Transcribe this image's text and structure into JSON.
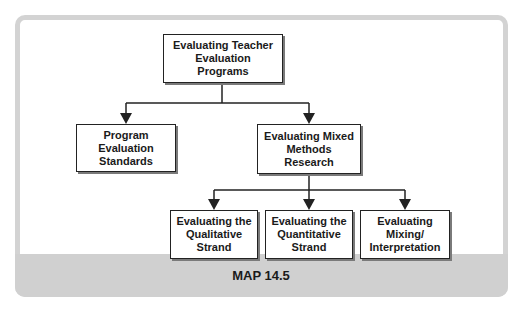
{
  "figure": {
    "caption": "MAP 14.5",
    "colors": {
      "frame": "#d3d3d3",
      "caption_bar": "#d0d0d0",
      "node_border": "#222222",
      "node_shadow": "#7a7a7a"
    }
  },
  "nodes": {
    "root": "Evaluating Teacher\nEvaluation\nPrograms",
    "standards": "Program\nEvaluation\nStandards",
    "mixed": "Evaluating Mixed\nMethods\nResearch",
    "qualitative": "Evaluating the\nQualitative\nStrand",
    "quantitative": "Evaluating the\nQuantitative\nStrand",
    "mixing": "Evaluating\nMixing/\nInterpretation"
  },
  "edges": [
    {
      "from": "root",
      "to": "standards"
    },
    {
      "from": "root",
      "to": "mixed"
    },
    {
      "from": "mixed",
      "to": "qualitative"
    },
    {
      "from": "mixed",
      "to": "quantitative"
    },
    {
      "from": "mixed",
      "to": "mixing"
    }
  ]
}
